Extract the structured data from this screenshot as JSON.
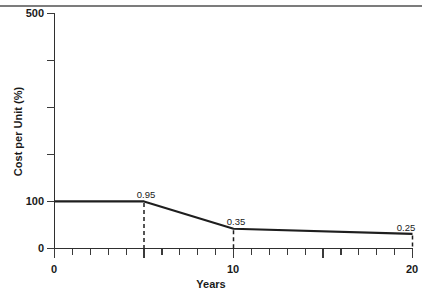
{
  "chart_data": {
    "type": "line",
    "title": "",
    "xlabel": "Years",
    "ylabel": "Cost per Unit (%)",
    "xlim": [
      0,
      20
    ],
    "ylim": [
      0,
      500
    ],
    "grid": false,
    "legend": null,
    "x_ticks_major": [
      0,
      5,
      10,
      15,
      20
    ],
    "x_tick_labels": [
      "0",
      "10",
      "20"
    ],
    "x_tick_label_values": [
      0,
      10,
      20
    ],
    "x_tick_minor_step": 1,
    "y_ticks": [
      0,
      100,
      200,
      300,
      400,
      500
    ],
    "y_tick_labels": [
      "0",
      "100",
      "500"
    ],
    "y_tick_label_values": [
      0,
      100,
      500
    ],
    "series": [
      {
        "name": "Cost per Unit",
        "x": [
          0,
          5,
          10,
          20
        ],
        "values": [
          100,
          100,
          42,
          31
        ]
      }
    ],
    "annotations": [
      {
        "label": "0.95",
        "x": 5,
        "y": 100
      },
      {
        "label": "0.35",
        "x": 10,
        "y": 42
      },
      {
        "label": "0.25",
        "x": 20,
        "y": 31
      }
    ],
    "colors": {
      "line": "#1e1e1e",
      "axis": "#2f2f2f",
      "text": "#1a1a1a",
      "background": "#ffffff"
    }
  },
  "axis_labels": {
    "y_title": "Cost per Unit (%)",
    "x_title": "Years",
    "y_500": "500",
    "y_100": "100",
    "y_0": "0",
    "x_0": "0",
    "x_10": "10",
    "x_20": "20"
  },
  "point_labels": {
    "p1": "0.95",
    "p2": "0.35",
    "p3": "0.25"
  }
}
